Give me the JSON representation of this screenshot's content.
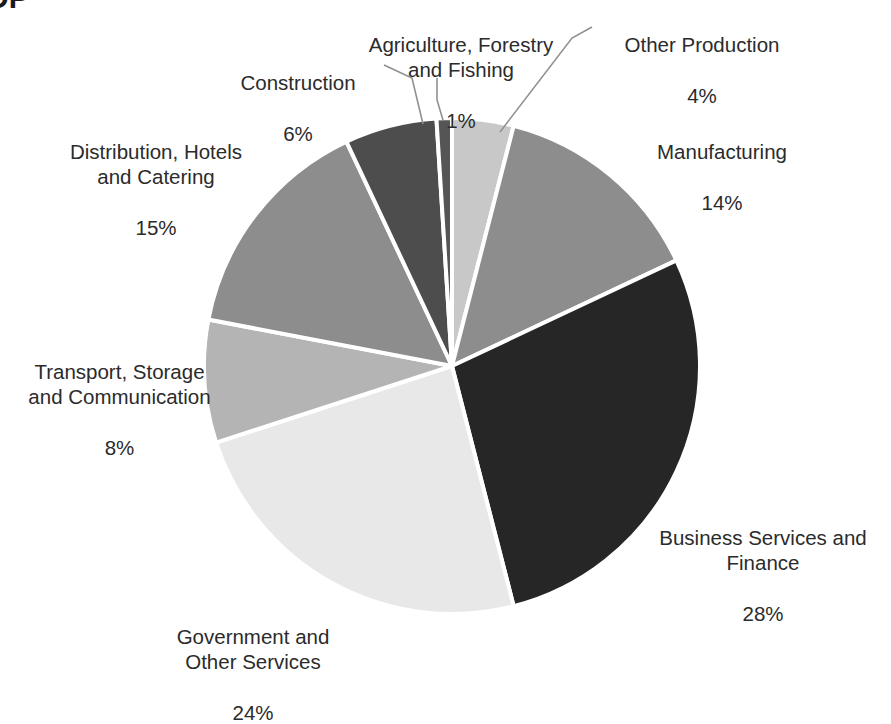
{
  "title_fragment": "DP",
  "chart_data": {
    "type": "pie",
    "title": "DP",
    "xlabel": "",
    "ylabel": "",
    "legend_position": "none",
    "grid": false,
    "start_angle_deg": 0,
    "direction": "clockwise",
    "units": "percent",
    "total": 100,
    "categories": [
      "Other Production",
      "Manufacturing",
      "Business Services and Finance",
      "Government and Other Services",
      "Transport, Storage and Communication",
      "Distribution, Hotels and Catering",
      "Construction",
      "Agriculture, Forestry and Fishing"
    ],
    "values": [
      4,
      14,
      28,
      24,
      8,
      15,
      6,
      1
    ],
    "colors": [
      "#c8c8c8",
      "#8d8d8d",
      "#262626",
      "#e8e8e8",
      "#b4b4b4",
      "#8d8d8d",
      "#4d4d4d",
      "#555555"
    ],
    "slices": [
      {
        "label": "Other Production",
        "value": 4,
        "value_text": "4%",
        "color": "#c8c8c8"
      },
      {
        "label": "Manufacturing",
        "value": 14,
        "value_text": "14%",
        "color": "#8d8d8d"
      },
      {
        "label": "Business Services and Finance",
        "value": 28,
        "value_text": "28%",
        "color": "#262626"
      },
      {
        "label": "Government and Other Services",
        "value": 24,
        "value_text": "24%",
        "color": "#e8e8e8"
      },
      {
        "label": "Transport, Storage and Communication",
        "value": 8,
        "value_text": "8%",
        "color": "#b4b4b4"
      },
      {
        "label": "Distribution, Hotels and Catering",
        "value": 15,
        "value_text": "15%",
        "color": "#8d8d8d"
      },
      {
        "label": "Construction",
        "value": 6,
        "value_text": "6%",
        "color": "#4d4d4d"
      },
      {
        "label": "Agriculture, Forestry and Fishing",
        "value": 1,
        "value_text": "1%",
        "color": "#555555"
      }
    ]
  },
  "labels": {
    "agriculture": {
      "name": "Agriculture, Forestry\nand Fishing",
      "value": "1%"
    },
    "other_production": {
      "name": "Other Production",
      "value": "4%"
    },
    "construction": {
      "name": "Construction",
      "value": "6%"
    },
    "manufacturing": {
      "name": "Manufacturing",
      "value": "14%"
    },
    "distribution": {
      "name": "Distribution, Hotels\nand Catering",
      "value": "15%"
    },
    "transport": {
      "name": "Transport, Storage\nand Communication",
      "value": "8%"
    },
    "business": {
      "name": "Business Services and\nFinance",
      "value": "28%"
    },
    "government": {
      "name": "Government and\nOther Services",
      "value": "24%"
    }
  },
  "style": {
    "background": "#ffffff",
    "slice_border": "#ffffff",
    "leader_line": "#909090",
    "text": "#2b2b2b"
  }
}
